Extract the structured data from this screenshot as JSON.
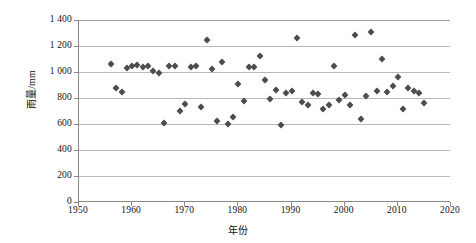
{
  "chart_data": {
    "type": "scatter",
    "title": "",
    "xlabel": "年份",
    "ylabel": "雨量/mm",
    "xlim": [
      1950,
      2020
    ],
    "ylim": [
      0,
      1400
    ],
    "grid": "horizontal",
    "legend": "none",
    "marker": {
      "shape": "diamond",
      "color": "#4d4d4d",
      "size": 5
    },
    "xticks": [
      1950,
      1960,
      1970,
      1980,
      1990,
      2000,
      2010,
      2020
    ],
    "xtick_labels": [
      "1950",
      "1960",
      "1970",
      "1980",
      "1990",
      "2000",
      "2010",
      "2020"
    ],
    "yticks": [
      0,
      200,
      400,
      600,
      800,
      1000,
      1200,
      1400
    ],
    "ytick_labels": [
      "0",
      "200",
      "400",
      "600",
      "800",
      "1 000",
      "1 200",
      "1 400"
    ],
    "series_name": "年雨量",
    "points": [
      {
        "x": 1956,
        "y": 1060
      },
      {
        "x": 1957,
        "y": 880
      },
      {
        "x": 1958,
        "y": 850
      },
      {
        "x": 1959,
        "y": 1030
      },
      {
        "x": 1960,
        "y": 1050
      },
      {
        "x": 1961,
        "y": 1055
      },
      {
        "x": 1962,
        "y": 1040
      },
      {
        "x": 1963,
        "y": 1050
      },
      {
        "x": 1964,
        "y": 1010
      },
      {
        "x": 1965,
        "y": 990
      },
      {
        "x": 1966,
        "y": 610
      },
      {
        "x": 1967,
        "y": 1045
      },
      {
        "x": 1968,
        "y": 1050
      },
      {
        "x": 1969,
        "y": 700
      },
      {
        "x": 1970,
        "y": 755
      },
      {
        "x": 1971,
        "y": 1040
      },
      {
        "x": 1972,
        "y": 1045
      },
      {
        "x": 1973,
        "y": 730
      },
      {
        "x": 1974,
        "y": 1250
      },
      {
        "x": 1975,
        "y": 1020
      },
      {
        "x": 1976,
        "y": 620
      },
      {
        "x": 1977,
        "y": 1080
      },
      {
        "x": 1978,
        "y": 600
      },
      {
        "x": 1979,
        "y": 655
      },
      {
        "x": 1980,
        "y": 910
      },
      {
        "x": 1981,
        "y": 780
      },
      {
        "x": 1982,
        "y": 1040
      },
      {
        "x": 1983,
        "y": 1035
      },
      {
        "x": 1984,
        "y": 1125
      },
      {
        "x": 1985,
        "y": 940
      },
      {
        "x": 1986,
        "y": 790
      },
      {
        "x": 1987,
        "y": 860
      },
      {
        "x": 1988,
        "y": 590
      },
      {
        "x": 1989,
        "y": 835
      },
      {
        "x": 1990,
        "y": 855
      },
      {
        "x": 1991,
        "y": 1265
      },
      {
        "x": 1992,
        "y": 770
      },
      {
        "x": 1993,
        "y": 745
      },
      {
        "x": 1994,
        "y": 835
      },
      {
        "x": 1995,
        "y": 830
      },
      {
        "x": 1996,
        "y": 715
      },
      {
        "x": 1997,
        "y": 750
      },
      {
        "x": 1998,
        "y": 1045
      },
      {
        "x": 1999,
        "y": 785
      },
      {
        "x": 2000,
        "y": 820
      },
      {
        "x": 2001,
        "y": 745
      },
      {
        "x": 2002,
        "y": 1285
      },
      {
        "x": 2003,
        "y": 640
      },
      {
        "x": 2004,
        "y": 815
      },
      {
        "x": 2005,
        "y": 1310
      },
      {
        "x": 2006,
        "y": 855
      },
      {
        "x": 2007,
        "y": 1100
      },
      {
        "x": 2008,
        "y": 845
      },
      {
        "x": 2009,
        "y": 890
      },
      {
        "x": 2010,
        "y": 960
      },
      {
        "x": 2011,
        "y": 715
      },
      {
        "x": 2012,
        "y": 880
      },
      {
        "x": 2013,
        "y": 855
      },
      {
        "x": 2014,
        "y": 840
      },
      {
        "x": 2015,
        "y": 760
      }
    ]
  }
}
